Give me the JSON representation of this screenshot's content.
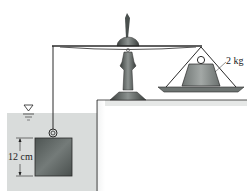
{
  "diagram": {
    "type": "physics-balance-buoyancy",
    "labels": {
      "counterweight_mass": "2 kg",
      "block_height": "12 cm"
    },
    "symbols": {
      "water_surface": "free-surface-triangle"
    },
    "colors": {
      "water": "#d9dcdb",
      "block": "#5f6664",
      "weight": "#8a8f8d",
      "ledge": "#e2e4e3",
      "outline": "#2a2a2a"
    }
  }
}
